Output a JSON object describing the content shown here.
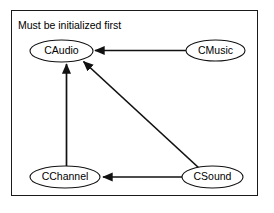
{
  "diagram": {
    "title": "Must be initialized first",
    "frame": {
      "stroke_color": "#1a1a1a",
      "fill_color": "#ffffff"
    },
    "nodes": [
      {
        "id": "caudio",
        "label": "CAudio",
        "cx": 61.5,
        "cy": 51,
        "rx": 31.5,
        "ry": 11
      },
      {
        "id": "cmusic",
        "label": "CMusic",
        "cx": 215.5,
        "cy": 50.5,
        "rx": 29.5,
        "ry": 10.5
      },
      {
        "id": "cchannel",
        "label": "CChannel",
        "cx": 65,
        "cy": 177,
        "rx": 35,
        "ry": 11
      },
      {
        "id": "csound",
        "label": "CSound",
        "cx": 212.5,
        "cy": 177,
        "rx": 30.5,
        "ry": 11
      }
    ],
    "edges": [
      {
        "id": "cmusic-to-caudio",
        "from": "CMusic",
        "to": "CAudio",
        "kind": "horizontal"
      },
      {
        "id": "cchannel-to-caudio",
        "from": "CChannel",
        "to": "CAudio",
        "kind": "vertical"
      },
      {
        "id": "csound-to-caudio",
        "from": "CSound",
        "to": "CAudio",
        "kind": "diagonal"
      },
      {
        "id": "csound-to-cchannel",
        "from": "CSound",
        "to": "CChannel",
        "kind": "horizontal"
      }
    ],
    "colors": {
      "stroke": "#111111",
      "text": "#000000",
      "background": "#ffffff"
    }
  }
}
